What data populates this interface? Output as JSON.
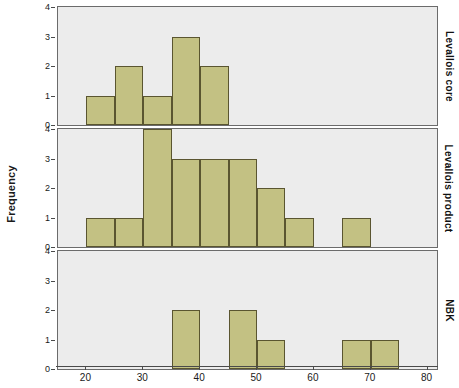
{
  "chart_data": {
    "type": "bar",
    "title": "",
    "subtitle": "",
    "xlabel": "",
    "ylabel": "Frequency",
    "xlim": [
      15,
      82
    ],
    "ylim": [
      0,
      4
    ],
    "yticks": [
      0,
      1,
      2,
      3,
      4
    ],
    "xticks": [
      20,
      30,
      40,
      50,
      60,
      70,
      80
    ],
    "bin_width": 5,
    "grid": false,
    "legend": "none",
    "panel_label_position": "right",
    "bar_fill_color": "#c3c183",
    "bar_edge_color": "#5a5530",
    "panel_background": "#ececec",
    "panels": [
      {
        "label": "Levallois core",
        "bins": [
          {
            "x0": 20,
            "x1": 25,
            "value": 1
          },
          {
            "x0": 25,
            "x1": 30,
            "value": 2
          },
          {
            "x0": 30,
            "x1": 35,
            "value": 1
          },
          {
            "x0": 35,
            "x1": 40,
            "value": 3
          },
          {
            "x0": 40,
            "x1": 45,
            "value": 2
          }
        ]
      },
      {
        "label": "Levallois product",
        "bins": [
          {
            "x0": 20,
            "x1": 25,
            "value": 1
          },
          {
            "x0": 25,
            "x1": 30,
            "value": 1
          },
          {
            "x0": 30,
            "x1": 35,
            "value": 4
          },
          {
            "x0": 35,
            "x1": 40,
            "value": 3
          },
          {
            "x0": 40,
            "x1": 45,
            "value": 3
          },
          {
            "x0": 45,
            "x1": 50,
            "value": 3
          },
          {
            "x0": 50,
            "x1": 55,
            "value": 2
          },
          {
            "x0": 55,
            "x1": 60,
            "value": 1
          },
          {
            "x0": 65,
            "x1": 70,
            "value": 1
          }
        ]
      },
      {
        "label": "NBK",
        "bins": [
          {
            "x0": 35,
            "x1": 40,
            "value": 2
          },
          {
            "x0": 45,
            "x1": 50,
            "value": 2
          },
          {
            "x0": 50,
            "x1": 55,
            "value": 1
          },
          {
            "x0": 65,
            "x1": 70,
            "value": 1
          },
          {
            "x0": 70,
            "x1": 75,
            "value": 1
          }
        ]
      }
    ]
  }
}
